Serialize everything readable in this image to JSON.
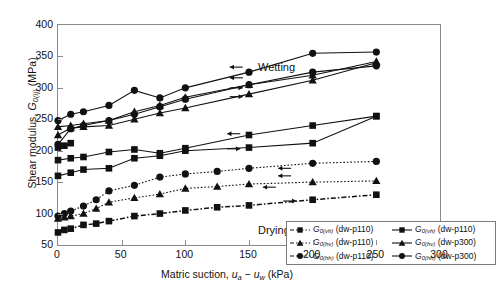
{
  "chart_data": {
    "type": "line",
    "title": "",
    "xlabel_plain": "Matric suction, ua - uw (kPa)",
    "ylabel_plain": "Shear modulus, G0(ij) (MPa)",
    "xlim": [
      0,
      300
    ],
    "ylim": [
      50,
      400
    ],
    "xticks": [
      0,
      50,
      100,
      150,
      200,
      250,
      300
    ],
    "yticks": [
      50,
      100,
      150,
      200,
      250,
      300,
      350,
      400
    ],
    "grid": false,
    "legend_position": "lower-right-inside",
    "annotations": [
      {
        "text": "Wetting",
        "x": 155,
        "y": 372
      },
      {
        "text": "Drying",
        "x": 155,
        "y": 115
      }
    ],
    "series": [
      {
        "name": "G0(vh) (dw-p110) drying",
        "marker": "square",
        "line": "dash-dot",
        "path": "drying",
        "x": [
          0,
          5,
          10,
          20,
          30,
          40,
          60,
          80,
          100,
          125,
          150,
          200,
          250
        ],
        "y": [
          70,
          74,
          76,
          82,
          84,
          88,
          96,
          100,
          105,
          110,
          113,
          122,
          130
        ]
      },
      {
        "name": "G0(hv) (dw-p110) drying",
        "marker": "triangle",
        "line": "dotted",
        "path": "drying",
        "x": [
          0,
          5,
          10,
          20,
          30,
          40,
          60,
          80,
          100,
          125,
          150,
          200,
          250
        ],
        "y": [
          92,
          94,
          96,
          100,
          108,
          118,
          125,
          131,
          140,
          143,
          147,
          150,
          152
        ]
      },
      {
        "name": "G0(hh) (dw-p110) drying",
        "marker": "circle",
        "line": "dotted",
        "path": "drying",
        "x": [
          0,
          5,
          10,
          20,
          30,
          40,
          60,
          80,
          100,
          125,
          150,
          200,
          250
        ],
        "y": [
          96,
          100,
          104,
          112,
          122,
          136,
          145,
          158,
          163,
          167,
          172,
          180,
          183
        ]
      },
      {
        "name": "G0(vh) (dw-p110) wetting",
        "marker": "square",
        "line": "solid",
        "path": "wetting",
        "x": [
          0,
          10,
          20,
          40,
          60,
          80,
          100,
          150,
          200,
          250
        ],
        "y": [
          160,
          165,
          170,
          172,
          188,
          192,
          200,
          205,
          212,
          255
        ]
      },
      {
        "name": "G0(hv) (dw-p300) wetting",
        "marker": "square",
        "line": "solid",
        "path": "wetting",
        "x": [
          0,
          10,
          20,
          40,
          60,
          80,
          100,
          150,
          200,
          250
        ],
        "y": [
          185,
          188,
          190,
          198,
          202,
          196,
          204,
          225,
          240,
          255
        ]
      },
      {
        "name": "G0(hh) (dw-p300) wetting",
        "marker": "square",
        "line": "solid",
        "path": "wetting",
        "x": [
          0,
          5,
          10
        ],
        "y": [
          205,
          208,
          212
        ]
      },
      {
        "name": "G0(vh) (dw-p110) wetting upper A",
        "marker": "triangle",
        "line": "solid",
        "path": "wetting",
        "x": [
          0,
          10,
          20,
          40,
          60,
          80,
          100,
          150,
          200,
          250
        ],
        "y": [
          225,
          236,
          238,
          240,
          250,
          260,
          268,
          290,
          312,
          340
        ]
      },
      {
        "name": "G0(hv) (dw-p300) wetting upper A2",
        "marker": "triangle",
        "line": "solid",
        "path": "wetting",
        "x": [
          0,
          10,
          20,
          40,
          60,
          80,
          100,
          150,
          200,
          250
        ],
        "y": [
          238,
          240,
          243,
          248,
          262,
          272,
          285,
          305,
          320,
          342
        ]
      },
      {
        "name": "G0(hh) (dw-p110) wetting upper C",
        "marker": "circle",
        "line": "solid",
        "path": "wetting",
        "x": [
          0,
          10,
          20,
          40,
          60,
          80,
          100,
          150,
          200,
          250
        ],
        "y": [
          210,
          235,
          240,
          248,
          258,
          270,
          282,
          305,
          325,
          335
        ]
      },
      {
        "name": "G0(hh) (dw-p300) wetting upper C2",
        "marker": "circle",
        "line": "solid",
        "path": "wetting",
        "x": [
          0,
          10,
          20,
          40,
          60,
          80,
          100,
          150,
          200,
          250
        ],
        "y": [
          248,
          258,
          262,
          272,
          296,
          284,
          300,
          325,
          355,
          357
        ]
      }
    ],
    "arrows": [
      {
        "x": 140,
        "y": 333,
        "dir": "left"
      },
      {
        "x": 140,
        "y": 316,
        "dir": "left"
      },
      {
        "x": 140,
        "y": 300,
        "dir": "right"
      },
      {
        "x": 140,
        "y": 286,
        "dir": "right"
      },
      {
        "x": 138,
        "y": 227,
        "dir": "left"
      },
      {
        "x": 138,
        "y": 203,
        "dir": "right"
      },
      {
        "x": 178,
        "y": 172,
        "dir": "left"
      },
      {
        "x": 178,
        "y": 160,
        "dir": "left"
      },
      {
        "x": 166,
        "y": 142,
        "dir": "left"
      },
      {
        "x": 182,
        "y": 120,
        "dir": "right"
      }
    ]
  },
  "axes": {
    "ylabel": {
      "pre": "Shear modulus, ",
      "g": "G",
      "sub": "0(ij)",
      "post": " (MPa)"
    },
    "xlabel": {
      "pre": "Matric suction, ",
      "ua": "u",
      "ua_sub": "a",
      "minus": " − ",
      "uw": "u",
      "uw_sub": "w",
      "post": " (kPa)"
    },
    "yticks": [
      "400",
      "350",
      "300",
      "250",
      "200",
      "150",
      "100",
      "50"
    ],
    "xticks": [
      "0",
      "50",
      "100",
      "150",
      "200",
      "250",
      "300"
    ]
  },
  "annotations": {
    "wetting": "Wetting",
    "drying": "Drying"
  },
  "legend": {
    "items": [
      {
        "marker": "square",
        "line": "dashdot",
        "g": "G",
        "sub": "0(vh)",
        "cond": "(dw-p110)"
      },
      {
        "marker": "square",
        "line": "solid",
        "g": "G",
        "sub": "0(vh)",
        "cond": "(dw-p110)"
      },
      {
        "marker": "triangle",
        "line": "dashdot",
        "g": "G",
        "sub": "0(hv)",
        "cond": "(dw-p110)"
      },
      {
        "marker": "triangle",
        "line": "solid",
        "g": "G",
        "sub": "0(hv)",
        "cond": "(dw-p300)"
      },
      {
        "marker": "circle",
        "line": "dashdot",
        "g": "G",
        "sub": "0(hh)",
        "cond": "(dw-p110)"
      },
      {
        "marker": "circle",
        "line": "solid",
        "g": "G",
        "sub": "0(hh)",
        "cond": "(dw-p300)"
      }
    ]
  },
  "colors": {
    "line": "#111111",
    "marker": "#111111",
    "axis": "#8a8a8a",
    "background": "#ffffff"
  }
}
